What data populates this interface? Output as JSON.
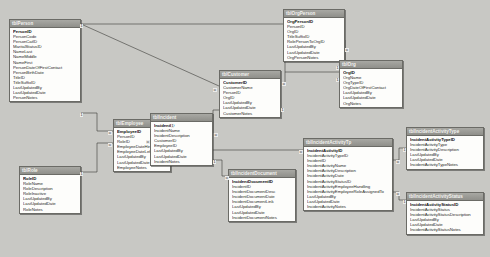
{
  "diagram": {
    "background": "#c8c8c4",
    "header_color": "#9a9a96",
    "body_color": "#fdfdfb"
  },
  "tables": [
    {
      "id": "tblPerson",
      "name": "tblPerson",
      "x": 9,
      "y": 19,
      "w": 72,
      "fields": [
        {
          "name": "PersonID",
          "pk": true
        },
        {
          "name": "PersonCode",
          "pk": false
        },
        {
          "name": "PersonCatID",
          "pk": false
        },
        {
          "name": "MaritalStatusID",
          "pk": false
        },
        {
          "name": "NameLast",
          "pk": false
        },
        {
          "name": "NameMiddle",
          "pk": false
        },
        {
          "name": "NameFirst",
          "pk": false
        },
        {
          "name": "PersonDateOfFirstContact",
          "pk": false
        },
        {
          "name": "PersonBirthDate",
          "pk": false
        },
        {
          "name": "TitleID",
          "pk": false
        },
        {
          "name": "TitleSuffixID",
          "pk": false
        },
        {
          "name": "LastUpdatedBy",
          "pk": false
        },
        {
          "name": "LastUpdatedDate",
          "pk": false
        },
        {
          "name": "PersonNotes",
          "pk": false
        }
      ]
    },
    {
      "id": "tblRole",
      "name": "tblRole",
      "x": 19,
      "y": 166,
      "w": 62,
      "fields": [
        {
          "name": "RoleID",
          "pk": true
        },
        {
          "name": "RoleName",
          "pk": false
        },
        {
          "name": "RoleDescription",
          "pk": false
        },
        {
          "name": "RoleInactive",
          "pk": false
        },
        {
          "name": "LastUpdatedBy",
          "pk": false
        },
        {
          "name": "LastUpdatedDate",
          "pk": false
        },
        {
          "name": "RoleNotes",
          "pk": false
        }
      ]
    },
    {
      "id": "tblEmployee",
      "name": "tblEmployee",
      "x": 113,
      "y": 119,
      "w": 58,
      "fields": [
        {
          "name": "EmployeeID",
          "pk": true
        },
        {
          "name": "PersonID",
          "pk": false
        },
        {
          "name": "RoleID",
          "pk": false
        },
        {
          "name": "EmployeeDateHired",
          "pk": false
        },
        {
          "name": "EmployeeDateLeft",
          "pk": false
        },
        {
          "name": "LastUpdatedBy",
          "pk": false
        },
        {
          "name": "LastUpdatedDate",
          "pk": false
        },
        {
          "name": "EmployeeNotes",
          "pk": false
        }
      ]
    },
    {
      "id": "tblIncident",
      "name": "tblIncident",
      "x": 150,
      "y": 113,
      "w": 63,
      "fields": [
        {
          "name": "IncidentID",
          "pk": true
        },
        {
          "name": "IncidentName",
          "pk": false
        },
        {
          "name": "IncidentDescription",
          "pk": false
        },
        {
          "name": "CustomerID",
          "pk": false
        },
        {
          "name": "EmployeeID",
          "pk": false
        },
        {
          "name": "LastUpdatedBy",
          "pk": false
        },
        {
          "name": "LastUpdatedDate",
          "pk": false
        },
        {
          "name": "IncidentNotes",
          "pk": false
        }
      ]
    },
    {
      "id": "tblCustomer",
      "name": "tblCustomer",
      "x": 219,
      "y": 70,
      "w": 62,
      "fields": [
        {
          "name": "CustomerID",
          "pk": true
        },
        {
          "name": "CustomerName",
          "pk": false
        },
        {
          "name": "PersonID",
          "pk": false
        },
        {
          "name": "OrgID",
          "pk": false
        },
        {
          "name": "LastUpdatedBy",
          "pk": false
        },
        {
          "name": "LastUpdatedDate",
          "pk": false
        },
        {
          "name": "CustomerNotes",
          "pk": false
        }
      ]
    },
    {
      "id": "tblOrgPerson",
      "name": "tblOrgPerson",
      "x": 283,
      "y": 9,
      "w": 62,
      "fields": [
        {
          "name": "OrgPersonID",
          "pk": true
        },
        {
          "name": "PersonID",
          "pk": false
        },
        {
          "name": "OrgID",
          "pk": false
        },
        {
          "name": "TitleSuffixID",
          "pk": false
        },
        {
          "name": "RolePersonToOrgID",
          "pk": false
        },
        {
          "name": "LastUpdatedBy",
          "pk": false
        },
        {
          "name": "LastUpdatedDate",
          "pk": false
        },
        {
          "name": "OrgPersonNotes",
          "pk": false
        }
      ]
    },
    {
      "id": "tblOrg",
      "name": "tblOrg",
      "x": 339,
      "y": 60,
      "w": 64,
      "fields": [
        {
          "name": "OrgID",
          "pk": true
        },
        {
          "name": "OrgName",
          "pk": false
        },
        {
          "name": "OrgTypeID",
          "pk": false
        },
        {
          "name": "OrgDateOfFirstContact",
          "pk": false
        },
        {
          "name": "LastUpdatedBy",
          "pk": false
        },
        {
          "name": "LastUpdatedDate",
          "pk": false
        },
        {
          "name": "OrgNotes",
          "pk": false
        }
      ]
    },
    {
      "id": "tblIncidentDocument",
      "name": "tblIncidentDocument",
      "x": 228,
      "y": 169,
      "w": 68,
      "fields": [
        {
          "name": "IncidentDocumentID",
          "pk": true
        },
        {
          "name": "IncidentID",
          "pk": false
        },
        {
          "name": "IncidentDocumentDesc",
          "pk": false
        },
        {
          "name": "IncidentDocumentDate",
          "pk": false
        },
        {
          "name": "IncidentDocumentLink",
          "pk": false
        },
        {
          "name": "LastUpdatedBy",
          "pk": false
        },
        {
          "name": "LastUpdatedDate",
          "pk": false
        },
        {
          "name": "IncidentDocumentNotes",
          "pk": false
        }
      ]
    },
    {
      "id": "tblIncidentActivityTp",
      "name": "tblIncidentActivityTp",
      "x": 303,
      "y": 138,
      "w": 90,
      "fields": [
        {
          "name": "IncidentActivityID",
          "pk": true
        },
        {
          "name": "IncidentActivityTypeID",
          "pk": false
        },
        {
          "name": "IncidentID",
          "pk": false
        },
        {
          "name": "IncidentActivityName",
          "pk": false
        },
        {
          "name": "IncidentActivityDescription",
          "pk": false
        },
        {
          "name": "IncidentActivityDate",
          "pk": false
        },
        {
          "name": "IncidentActivityStatusID",
          "pk": false
        },
        {
          "name": "IncidentActivityEmployeeHandling",
          "pk": false
        },
        {
          "name": "IncidentActivityEmployeeRoleAssignedTo",
          "pk": false
        },
        {
          "name": "LastUpdatedBy",
          "pk": false
        },
        {
          "name": "LastUpdatedDate",
          "pk": false
        },
        {
          "name": "IncidentActivityNotes",
          "pk": false
        }
      ]
    },
    {
      "id": "tblIncidentActivityType",
      "name": "tblIncidentActivityType",
      "x": 406,
      "y": 127,
      "w": 78,
      "fields": [
        {
          "name": "IncidentActivityTypeID",
          "pk": true
        },
        {
          "name": "IncidentActivityType",
          "pk": false
        },
        {
          "name": "IncidentActivityDescription",
          "pk": false
        },
        {
          "name": "LastUpdatedBy",
          "pk": false
        },
        {
          "name": "LastUpdatedDate",
          "pk": false
        },
        {
          "name": "IncidentActivityTypeNotes",
          "pk": false
        }
      ]
    },
    {
      "id": "tblIncidentActivityStatus",
      "name": "tblIncidentActivityStatus",
      "x": 406,
      "y": 192,
      "w": 78,
      "fields": [
        {
          "name": "IncidentActivityStatusID",
          "pk": true
        },
        {
          "name": "IncidentActivityStatus",
          "pk": false
        },
        {
          "name": "IncidentActivityStatusDescription",
          "pk": false
        },
        {
          "name": "LastUpdatedBy",
          "pk": false
        },
        {
          "name": "LastUpdatedDate",
          "pk": false
        },
        {
          "name": "IncidentActivityStatusNotes",
          "pk": false
        }
      ]
    }
  ],
  "relationships": [
    {
      "from": "tblPerson",
      "to": "tblOrgPerson",
      "from_card": "1",
      "to_card": "∞"
    },
    {
      "from": "tblPerson",
      "to": "tblCustomer",
      "from_card": "1",
      "to_card": "∞"
    },
    {
      "from": "tblPerson",
      "to": "tblEmployee",
      "from_card": "1",
      "to_card": "∞"
    },
    {
      "from": "tblRole",
      "to": "tblEmployee",
      "from_card": "1",
      "to_card": "∞"
    },
    {
      "from": "tblEmployee",
      "to": "tblIncident",
      "from_card": "1",
      "to_card": "∞"
    },
    {
      "from": "tblCustomer",
      "to": "tblIncident",
      "from_card": "1",
      "to_card": "∞"
    },
    {
      "from": "tblOrg",
      "to": "tblOrgPerson",
      "from_card": "1",
      "to_card": "∞"
    },
    {
      "from": "tblOrg",
      "to": "tblCustomer",
      "from_card": "1",
      "to_card": "∞"
    },
    {
      "from": "tblIncident",
      "to": "tblIncidentDocument",
      "from_card": "1",
      "to_card": "∞"
    },
    {
      "from": "tblIncident",
      "to": "tblIncidentActivityTp",
      "from_card": "1",
      "to_card": "∞"
    },
    {
      "from": "tblIncidentActivityType",
      "to": "tblIncidentActivityTp",
      "from_card": "1",
      "to_card": "∞"
    },
    {
      "from": "tblIncidentActivityStatus",
      "to": "tblIncidentActivityTp",
      "from_card": "1",
      "to_card": "∞"
    }
  ],
  "cardinality_labels": [
    {
      "text": "1",
      "x": 80,
      "y": 24
    },
    {
      "text": "∞",
      "x": 213,
      "y": 88
    },
    {
      "text": "1",
      "x": 80,
      "y": 113
    },
    {
      "text": "∞",
      "x": 108,
      "y": 131
    },
    {
      "text": "1",
      "x": 80,
      "y": 172
    },
    {
      "text": "∞",
      "x": 108,
      "y": 143
    },
    {
      "text": "1",
      "x": 171,
      "y": 124
    },
    {
      "text": "∞",
      "x": 146,
      "y": 140
    },
    {
      "text": "1",
      "x": 281,
      "y": 108
    },
    {
      "text": "∞",
      "x": 214,
      "y": 133
    },
    {
      "text": "1",
      "x": 336,
      "y": 66
    },
    {
      "text": "∞",
      "x": 282,
      "y": 82
    },
    {
      "text": "1",
      "x": 336,
      "y": 78
    },
    {
      "text": "∞",
      "x": 345,
      "y": 48
    },
    {
      "text": "1",
      "x": 213,
      "y": 160
    },
    {
      "text": "∞",
      "x": 225,
      "y": 176
    },
    {
      "text": "∞",
      "x": 299,
      "y": 150
    },
    {
      "text": "1",
      "x": 403,
      "y": 148
    },
    {
      "text": "∞",
      "x": 396,
      "y": 160
    },
    {
      "text": "1",
      "x": 403,
      "y": 200
    },
    {
      "text": "∞",
      "x": 396,
      "y": 192
    }
  ]
}
